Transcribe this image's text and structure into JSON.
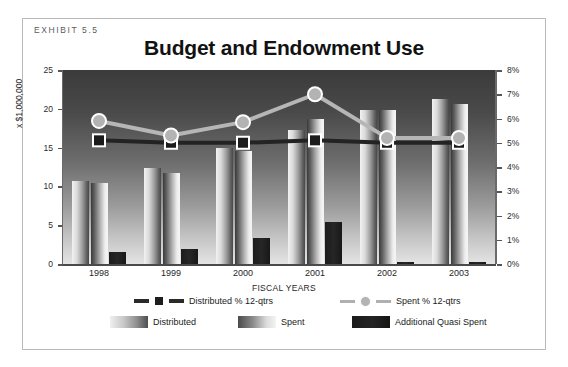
{
  "exhibit_label": "EXHIBIT 5.5",
  "chart_data": {
    "type": "bar",
    "title": "Budget and Endowment Use",
    "xlabel": "FISCAL YEARS",
    "ylabel": "x $1,000,000",
    "categories": [
      "1998",
      "1999",
      "2000",
      "2001",
      "2002",
      "2003"
    ],
    "ylim": [
      0,
      25
    ],
    "yticks": [
      "0",
      "5",
      "10",
      "15",
      "20",
      "25"
    ],
    "y2lim": [
      0,
      8
    ],
    "y2label": "%",
    "y2ticks": [
      "0%",
      "1%",
      "2%",
      "3%",
      "4%",
      "5%",
      "6%",
      "7%",
      "8%"
    ],
    "grid": false,
    "legend_position": "bottom",
    "series": [
      {
        "name": "Distributed",
        "type": "bar",
        "axis": "left",
        "values": [
          10.7,
          12.4,
          15.0,
          17.3,
          19.8,
          21.3
        ]
      },
      {
        "name": "Spent",
        "type": "bar",
        "axis": "left",
        "values": [
          10.5,
          11.7,
          14.6,
          18.7,
          19.8,
          20.6
        ]
      },
      {
        "name": "Additional Quasi Spent",
        "type": "bar",
        "axis": "left",
        "values": [
          1.5,
          1.9,
          3.4,
          5.4,
          0.3,
          0.3
        ]
      },
      {
        "name": "Distributed % 12-qtrs",
        "type": "line",
        "axis": "right",
        "values": [
          5.1,
          5.0,
          5.0,
          5.1,
          5.0,
          5.0
        ]
      },
      {
        "name": "Spent % 12-qtrs",
        "type": "line",
        "axis": "right",
        "values": [
          5.9,
          5.3,
          5.85,
          7.0,
          5.2,
          5.2
        ]
      }
    ]
  },
  "legend": {
    "line_items": [
      {
        "label": "Distributed % 12-qtrs",
        "marker": "square",
        "color": "#1e1e1e"
      },
      {
        "label": "Spent % 12-qtrs",
        "marker": "circle",
        "color": "#b3b3b3"
      }
    ],
    "bar_items": [
      {
        "label": "Distributed"
      },
      {
        "label": "Spent"
      },
      {
        "label": "Additional Quasi Spent"
      }
    ]
  }
}
